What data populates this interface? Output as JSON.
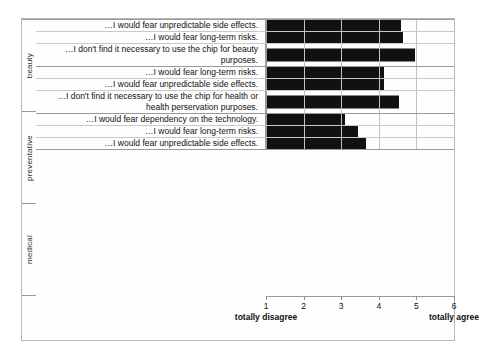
{
  "chart_data": {
    "type": "bar",
    "orientation": "horizontal",
    "title": "",
    "xlabel": "",
    "ylabel": "",
    "xlim": [
      1,
      6
    ],
    "xticks": [
      1,
      2,
      3,
      4,
      5,
      6
    ],
    "xtick_labels": [
      "1",
      "2",
      "3",
      "4",
      "5",
      "6"
    ],
    "scale_anchor_low": "totally disagree",
    "scale_anchor_high": "totally agree",
    "grid": true,
    "legend": false,
    "bar_color": "#111111",
    "groups": [
      {
        "name": "beauty",
        "items": [
          {
            "label": "…I would fear unpredictable side effects.",
            "value": 4.6
          },
          {
            "label": "…I would fear long-term risks.",
            "value": 4.65
          },
          {
            "label": "…I don't find it necessary to use the chip for beauty purposes.",
            "value": 4.95
          }
        ]
      },
      {
        "name": "preventative",
        "items": [
          {
            "label": "…I would fear long-term risks.",
            "value": 4.15
          },
          {
            "label": "…I would fear unpredictable side effects.",
            "value": 4.15
          },
          {
            "label": "…I don't find it necessary to use the chip for health or health perservation purposes.",
            "value": 4.55
          }
        ]
      },
      {
        "name": "medical",
        "items": [
          {
            "label": "…I would fear dependency on the technology.",
            "value": 3.1
          },
          {
            "label": "…I would fear long-term risks.",
            "value": 3.45
          },
          {
            "label": "…I would fear unpredictable side effects.",
            "value": 3.65
          }
        ]
      }
    ]
  }
}
